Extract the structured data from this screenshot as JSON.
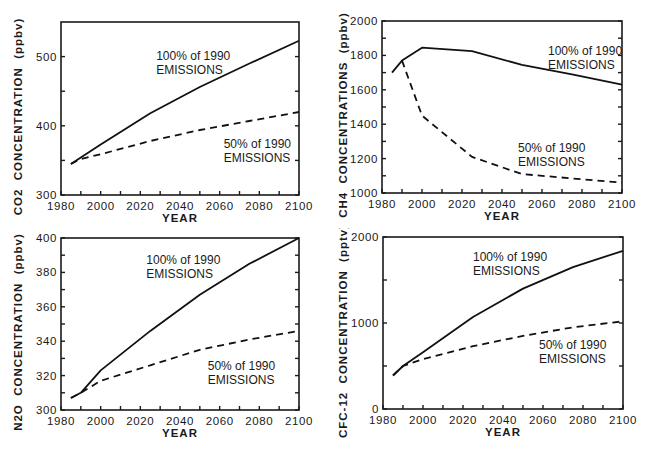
{
  "chart_data": [
    {
      "type": "line",
      "title": "",
      "xlabel": "YEAR",
      "ylabel": "CO2  CONCENTRATION  (ppbv)",
      "xlim": [
        1980,
        2100
      ],
      "ylim": [
        300,
        550
      ],
      "xticks": [
        1980,
        2000,
        2020,
        2040,
        2060,
        2080,
        2100
      ],
      "yticks": [
        300,
        400,
        500
      ],
      "grid": false,
      "x": [
        1985,
        1990,
        2000,
        2025,
        2050,
        2075,
        2100
      ],
      "series": [
        {
          "name": "100% of 1990 EMISSIONS",
          "style": "solid",
          "values": [
            345,
            354,
            373,
            418,
            456,
            490,
            523
          ]
        },
        {
          "name": "50% of 1990 EMISSIONS",
          "style": "dashed",
          "values": [
            345,
            352,
            359,
            378,
            394,
            407,
            420
          ]
        }
      ],
      "annotations": [
        {
          "text": [
            "100% of 1990",
            "EMISSIONS"
          ],
          "x": 2028,
          "y": 495
        },
        {
          "text": [
            "50% of 1990",
            "EMISSIONS"
          ],
          "x": 2062,
          "y": 368
        }
      ]
    },
    {
      "type": "line",
      "title": "",
      "xlabel": "YEAR",
      "ylabel": "CH4  CONCENTRATIONS  (ppbv)",
      "xlim": [
        1980,
        2100
      ],
      "ylim": [
        1000,
        2000
      ],
      "xticks": [
        1980,
        2000,
        2020,
        2040,
        2060,
        2080,
        2100
      ],
      "yticks": [
        1000,
        1200,
        1400,
        1600,
        1800,
        2000
      ],
      "grid": false,
      "x": [
        1985,
        1990,
        2000,
        2025,
        2050,
        2075,
        2100
      ],
      "series": [
        {
          "name": "100% of 1990 EMISSIONS",
          "style": "solid",
          "values": [
            1700,
            1770,
            1845,
            1825,
            1745,
            1690,
            1630
          ]
        },
        {
          "name": "50% of 1990 EMISSIONS",
          "style": "dashed",
          "values": [
            null,
            1770,
            1450,
            1210,
            1110,
            1085,
            1060
          ]
        }
      ],
      "annotations": [
        {
          "text": [
            "100% of 1990",
            "EMISSIONS"
          ],
          "x": 2063,
          "y": 1805
        },
        {
          "text": [
            "50% of 1990",
            "EMISSIONS"
          ],
          "x": 2048,
          "y": 1240
        }
      ]
    },
    {
      "type": "line",
      "title": "",
      "xlabel": "YEAR",
      "ylabel": "N2O  CONCENTRATION  (ppbv)",
      "xlim": [
        1980,
        2100
      ],
      "ylim": [
        300,
        400
      ],
      "xticks": [
        1980,
        2000,
        2020,
        2040,
        2060,
        2080,
        2100
      ],
      "yticks": [
        300,
        320,
        340,
        360,
        380,
        400
      ],
      "grid": false,
      "x": [
        1985,
        1990,
        2000,
        2025,
        2050,
        2075,
        2100
      ],
      "series": [
        {
          "name": "100% of 1990 EMISSIONS",
          "style": "solid",
          "values": [
            307,
            310,
            323,
            346,
            367,
            385,
            400
          ]
        },
        {
          "name": "50% of 1990 EMISSIONS",
          "style": "dashed",
          "values": [
            307,
            310,
            317,
            326,
            335,
            341,
            346
          ]
        }
      ],
      "annotations": [
        {
          "text": [
            "100% of 1990",
            "EMISSIONS"
          ],
          "x": 2023,
          "y": 385
        },
        {
          "text": [
            "50% of 1990",
            "EMISSIONS"
          ],
          "x": 2054,
          "y": 323
        }
      ]
    },
    {
      "type": "line",
      "title": "",
      "xlabel": "YEAR",
      "ylabel": "CFC-12  CONCENTRATION  (pptv)",
      "xlim": [
        1980,
        2100
      ],
      "ylim": [
        0,
        2000
      ],
      "xticks": [
        1980,
        2000,
        2020,
        2040,
        2060,
        2080,
        2100
      ],
      "yticks": [
        0,
        1000,
        2000
      ],
      "grid": false,
      "x": [
        1985,
        1990,
        2000,
        2025,
        2050,
        2075,
        2100
      ],
      "series": [
        {
          "name": "100% of 1990 EMISSIONS",
          "style": "solid",
          "values": [
            390,
            500,
            660,
            1070,
            1400,
            1650,
            1840
          ]
        },
        {
          "name": "50% of 1990 EMISSIONS",
          "style": "dashed",
          "values": [
            390,
            500,
            580,
            730,
            850,
            950,
            1020
          ]
        }
      ],
      "annotations": [
        {
          "text": [
            "100% of 1990",
            "EMISSIONS"
          ],
          "x": 2025,
          "y": 1720
        },
        {
          "text": [
            "50% of 1990",
            "EMISSIONS"
          ],
          "x": 2058,
          "y": 700
        }
      ]
    }
  ]
}
